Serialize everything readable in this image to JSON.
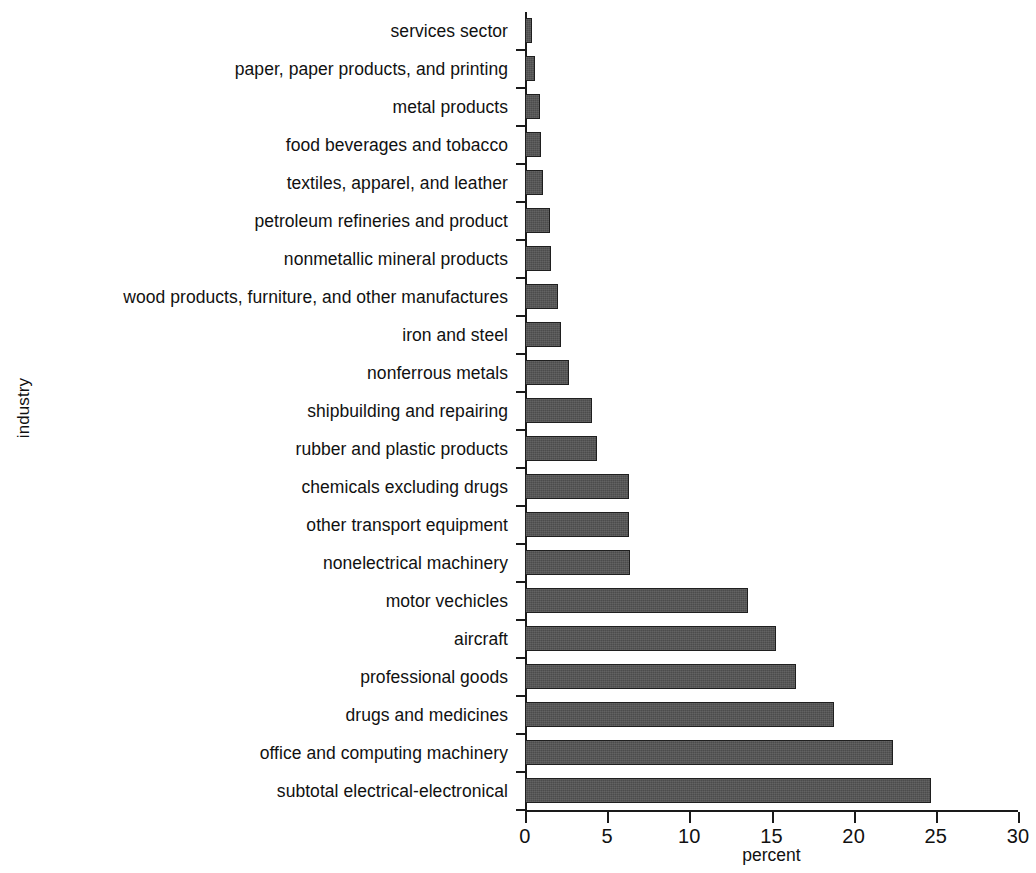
{
  "chart_data": {
    "type": "bar",
    "orientation": "horizontal",
    "title": "",
    "xlabel": "percent",
    "ylabel": "industry",
    "xlim": [
      0,
      30
    ],
    "xticks": [
      0,
      5,
      10,
      15,
      20,
      25,
      30
    ],
    "grid": false,
    "legend": null,
    "bar_color": "#4c4c4c",
    "categories": [
      "services sector",
      "paper, paper products, and printing",
      "metal products",
      "food beverages and tobacco",
      "textiles, apparel, and leather",
      "petroleum refineries and product",
      "nonmetallic mineral products",
      "wood products, furniture, and other manufactures",
      "iron and steel",
      "nonferrous metals",
      "shipbuilding and repairing",
      "rubber and plastic products",
      "chemicals excluding drugs",
      "other transport equipment",
      "nonelectrical machinery",
      "motor vechicles",
      "aircraft",
      "professional goods",
      "drugs and medicines",
      "office and computing machinery",
      "subtotal electrical-electronical"
    ],
    "values": [
      0.4,
      0.6,
      0.9,
      1.0,
      1.1,
      1.5,
      1.6,
      2.0,
      2.2,
      2.7,
      4.1,
      4.4,
      6.3,
      6.3,
      6.4,
      13.6,
      15.3,
      16.5,
      18.8,
      22.4,
      24.7
    ]
  }
}
